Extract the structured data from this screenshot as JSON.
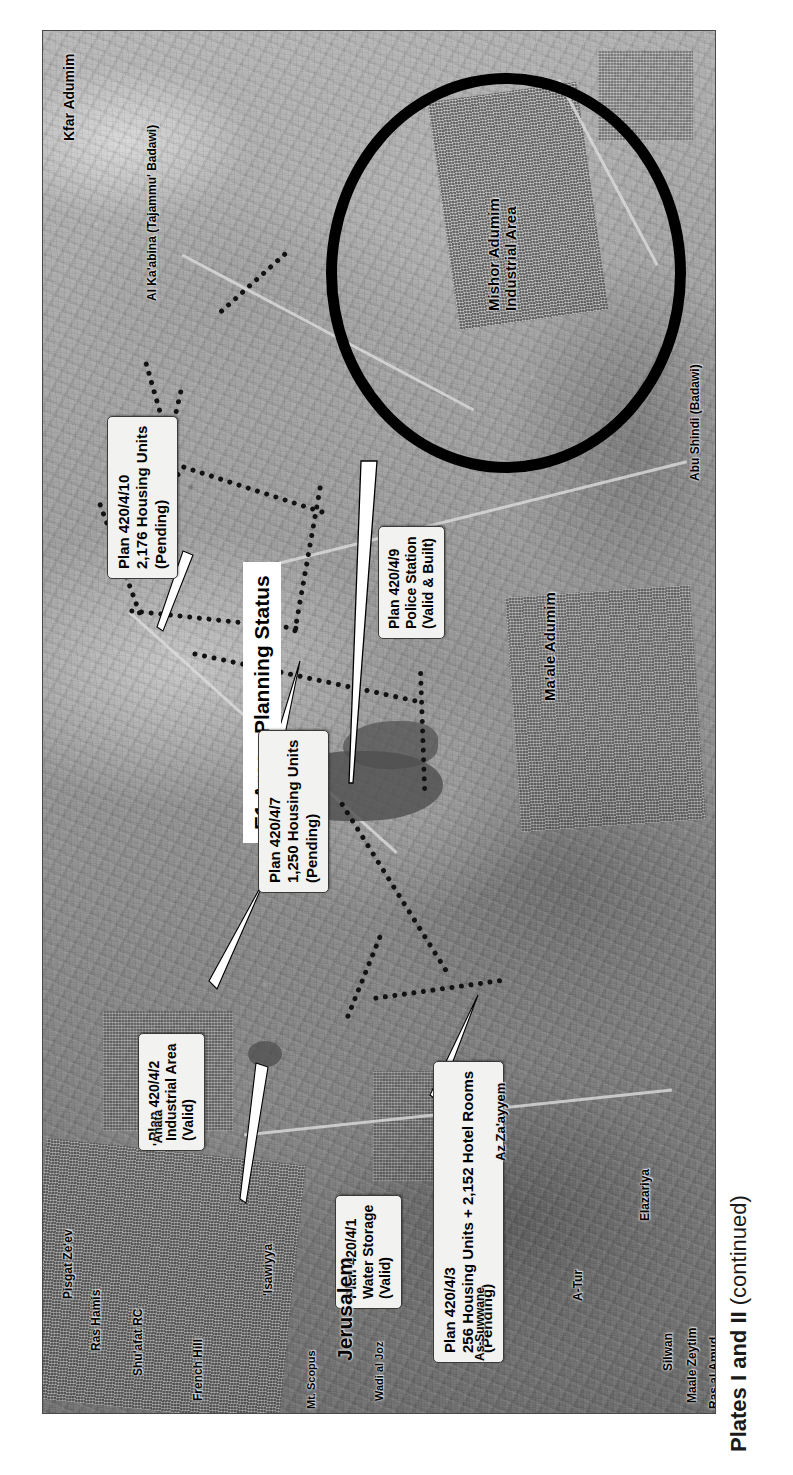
{
  "figure": {
    "caption_main": "Plates I and II",
    "caption_suffix": " (continued)"
  },
  "map": {
    "title": "E1 Area - Planning Status",
    "orientation_note": "rotated-90",
    "colors": {
      "annotation_circle": "#000000",
      "boundary_dotted": "#121212",
      "callout_fill": "#f2f2f0",
      "callout_border": "#3a3a3a",
      "label_text": "#000000"
    },
    "annotations": {
      "circle_highlight_target": "Mishor Adumim Industrial Area"
    },
    "callouts": [
      {
        "id": "plan-420-4-10",
        "lines": [
          "Plan 420/4/10",
          "2,176 Housing Units",
          "(Pending)"
        ],
        "plan": "420/4/10",
        "units": "2,176 Housing Units",
        "status": "Pending"
      },
      {
        "id": "plan-420-4-9",
        "lines": [
          "Plan 420/4/9",
          "Police Station",
          "(Valid & Built)"
        ],
        "plan": "420/4/9",
        "units": "Police Station",
        "status": "Valid & Built"
      },
      {
        "id": "plan-420-4-7",
        "lines": [
          "Plan 420/4/7",
          "1,250 Housing Units",
          "(Pending)"
        ],
        "plan": "420/4/7",
        "units": "1,250 Housing Units",
        "status": "Pending"
      },
      {
        "id": "plan-420-4-2",
        "lines": [
          "Plan 420/4/2",
          "Industrial Area",
          "(Valid)"
        ],
        "plan": "420/4/2",
        "units": "Industrial Area",
        "status": "Valid"
      },
      {
        "id": "plan-420-4-1",
        "lines": [
          "Plan 420/4/1",
          "Water Storage",
          "(Valid)"
        ],
        "plan": "420/4/1",
        "units": "Water Storage",
        "status": "Valid"
      },
      {
        "id": "plan-420-4-3",
        "lines": [
          "Plan 420/4/3",
          "256 Housing Units + 2,152 Hotel Rooms",
          "(Pending)"
        ],
        "plan": "420/4/3",
        "units": "256 Housing Units + 2,152 Hotel Rooms",
        "status": "Pending"
      }
    ],
    "place_labels": [
      {
        "id": "kfar-adumim",
        "text": "Kfar Adumim"
      },
      {
        "id": "al-karabina",
        "text": "Al Ka'abina (Tajammu' Badawi)"
      },
      {
        "id": "mishor-adumim",
        "text": "Mishor Adumim\nIndustrial Area"
      },
      {
        "id": "abu-shindi",
        "text": "Abu Shindi (Badawi)"
      },
      {
        "id": "maale-adumim",
        "text": "Ma'ale Adumim"
      },
      {
        "id": "az-zaayyem",
        "text": "Az Za'ayyem"
      },
      {
        "id": "anata",
        "text": "'Anata"
      },
      {
        "id": "elazariya",
        "text": "Elazariya"
      },
      {
        "id": "jerusalem",
        "text": "Jerusalem"
      },
      {
        "id": "isawiyya",
        "text": "'Isawiyya"
      },
      {
        "id": "a-tur",
        "text": "A-Tur"
      },
      {
        "id": "as-suwwane",
        "text": "As-Suwwane"
      },
      {
        "id": "wadi-al-joz",
        "text": "Wadi al Joz"
      },
      {
        "id": "mt-scopus",
        "text": "Mt. Scopus"
      },
      {
        "id": "french-hill",
        "text": "French Hill"
      },
      {
        "id": "shuafat-rc",
        "text": "Shu'afat RC"
      },
      {
        "id": "ras-hamis",
        "text": "Ras Hamis"
      },
      {
        "id": "pisgat-zeev",
        "text": "Pisgat Ze'ev"
      },
      {
        "id": "silwan",
        "text": "Silwan"
      },
      {
        "id": "maale-zeytim",
        "text": "Maale Zeytim"
      },
      {
        "id": "ras-al-amud",
        "text": "Ras al Amud"
      }
    ]
  }
}
